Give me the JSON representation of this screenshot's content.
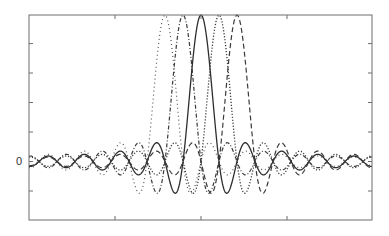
{
  "chart_data": {
    "type": "line",
    "title": "",
    "xlabel": "",
    "ylabel": "",
    "xlim": [
      -3.5,
      3.5
    ],
    "ylim": [
      -0.4,
      1.0
    ],
    "x_ticks": [
      -1,
      0,
      1
    ],
    "x_tick_labels": [
      "",
      "",
      ""
    ],
    "y_ticks": [
      -0.2,
      0,
      0.2,
      0.4,
      0.6,
      0.8
    ],
    "y_tick_labels": [
      "",
      "0",
      "",
      "",
      "",
      ""
    ],
    "grid": false,
    "legend": null,
    "function": "sinc: y = sin(pi*k*(x - shift)) / (pi*k*(x - shift)), k ≈ 4.78 (main-lobe zero crossings at ±0.21 from each center)",
    "series": [
      {
        "name": "shift -0.42",
        "shift": -0.42,
        "style": "dotted-light",
        "peak": 1.0
      },
      {
        "name": "shift -0.21",
        "shift": -0.21,
        "style": "dash-dot",
        "peak": 1.0
      },
      {
        "name": "shift 0",
        "shift": 0.0,
        "style": "solid",
        "peak": 1.0
      },
      {
        "name": "shift +0.21",
        "shift": 0.21,
        "style": "dotted",
        "peak": 1.0
      },
      {
        "name": "shift +0.42",
        "shift": 0.42,
        "style": "dashed",
        "peak": 1.0
      }
    ],
    "annotations": [
      "0"
    ]
  },
  "render": {
    "plot_px": {
      "left": 29,
      "right": 372,
      "top": 15,
      "bottom": 220
    },
    "zero_y_px": 161.5,
    "px_per_unit_y": 146.4,
    "center_x_px": 201,
    "px_per_pi": 18,
    "series_px_centers": [
      165,
      183,
      201,
      219,
      237
    ],
    "x_tick_px": [
      115,
      201,
      287
    ],
    "y_tick_px": [
      43.6,
      73,
      102.5,
      132,
      191
    ],
    "zero_label": "0",
    "line_color": "#3a3a3a",
    "axis_color": "#6e6e6e"
  }
}
